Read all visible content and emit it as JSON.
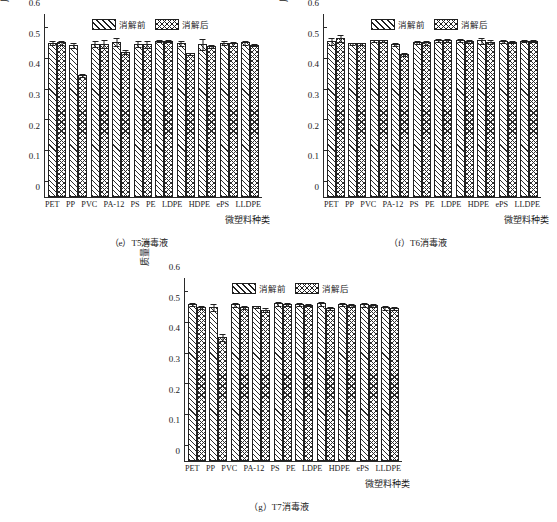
{
  "figure": {
    "ylabel": "质量/g",
    "xlabel": "微塑料种类",
    "legend": {
      "pre": "消解前",
      "post": "消解后"
    },
    "yticks": [
      "0",
      "0.1",
      "0.2",
      "0.3",
      "0.4",
      "0.5",
      "0.6"
    ],
    "categories": [
      "PET",
      "PP",
      "PVC",
      "PA-12",
      "PS",
      "PE",
      "LDPE",
      "HDPE",
      "ePS",
      "LLDPE"
    ]
  },
  "chart_data": [
    {
      "type": "bar",
      "panel": "e",
      "title": "（e）T5消毒液",
      "xlabel": "微塑料种类",
      "ylabel": "质量/g",
      "ylim": [
        0,
        0.6
      ],
      "categories": [
        "PET",
        "PP",
        "PVC",
        "PA-12",
        "PS",
        "PE",
        "LDPE",
        "HDPE",
        "ePS",
        "LLDPE"
      ],
      "series": [
        {
          "name": "消解前",
          "values": [
            0.503,
            0.496,
            0.5,
            0.507,
            0.5,
            0.509,
            0.501,
            0.499,
            0.503,
            0.504
          ],
          "errors": [
            0.008,
            0.01,
            0.012,
            0.015,
            0.012,
            0.005,
            0.01,
            0.018,
            0.008,
            0.008
          ]
        },
        {
          "name": "消解后",
          "values": [
            0.504,
            0.398,
            0.5,
            0.474,
            0.499,
            0.509,
            0.47,
            0.492,
            0.502,
            0.497
          ],
          "errors": [
            0.008,
            0.006,
            0.014,
            0.008,
            0.012,
            0.005,
            0.004,
            0.006,
            0.008,
            0.006
          ]
        }
      ],
      "grid": false,
      "legend_position": "top-center"
    },
    {
      "type": "bar",
      "panel": "f",
      "title": "（f）T6消毒液",
      "xlabel": "微塑料种类",
      "ylabel": "质量/g",
      "ylim": [
        0,
        0.6
      ],
      "categories": [
        "PET",
        "PP",
        "PVC",
        "PA-12",
        "PS",
        "PE",
        "LDPE",
        "HDPE",
        "ePS",
        "LLDPE"
      ],
      "series": [
        {
          "name": "消解前",
          "values": [
            0.508,
            0.502,
            0.511,
            0.499,
            0.505,
            0.512,
            0.512,
            0.511,
            0.508,
            0.51
          ],
          "errors": [
            0.013,
            0.004,
            0.005,
            0.007,
            0.007,
            0.005,
            0.006,
            0.012,
            0.006,
            0.006
          ]
        },
        {
          "name": "消解后",
          "values": [
            0.518,
            0.503,
            0.512,
            0.466,
            0.504,
            0.512,
            0.508,
            0.507,
            0.506,
            0.51
          ],
          "errors": [
            0.012,
            0.004,
            0.004,
            0.006,
            0.008,
            0.006,
            0.007,
            0.009,
            0.005,
            0.005
          ]
        }
      ],
      "grid": false,
      "legend_position": "top-center"
    },
    {
      "type": "bar",
      "panel": "g",
      "title": "（g）T7消毒液",
      "xlabel": "微塑料种类",
      "ylabel": "质量/g",
      "ylim": [
        0,
        0.6
      ],
      "categories": [
        "PET",
        "PP",
        "PVC",
        "PA-12",
        "PS",
        "PE",
        "LDPE",
        "HDPE",
        "ePS",
        "LLDPE"
      ],
      "series": [
        {
          "name": "消解前",
          "values": [
            0.511,
            0.501,
            0.511,
            0.504,
            0.514,
            0.511,
            0.514,
            0.513,
            0.511,
            0.501
          ],
          "errors": [
            0.007,
            0.013,
            0.008,
            0.005,
            0.007,
            0.006,
            0.008,
            0.006,
            0.008,
            0.007
          ]
        },
        {
          "name": "消解后",
          "values": [
            0.503,
            0.404,
            0.502,
            0.494,
            0.513,
            0.51,
            0.499,
            0.509,
            0.509,
            0.499
          ],
          "errors": [
            0.007,
            0.014,
            0.006,
            0.008,
            0.007,
            0.005,
            0.005,
            0.006,
            0.007,
            0.006
          ]
        }
      ],
      "grid": false,
      "legend_position": "top-center"
    }
  ]
}
